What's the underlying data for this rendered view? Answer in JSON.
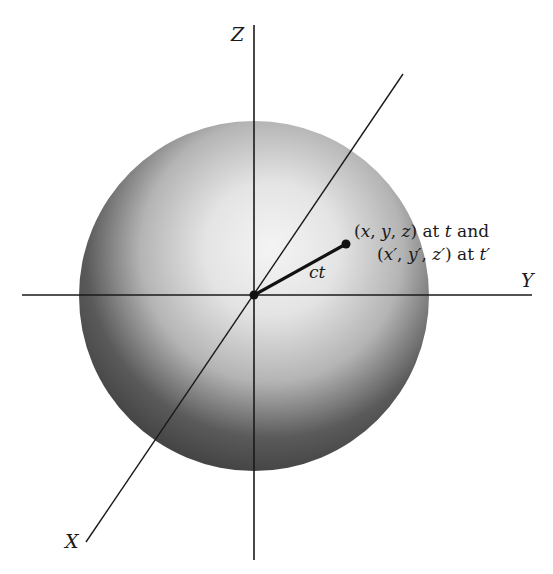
{
  "diagram": {
    "type": "3d-coordinate-system-with-sphere",
    "axes": {
      "z_label": "Z",
      "y_label": "Y",
      "x_label": "X"
    },
    "radius_label": "ct",
    "point_annotation": {
      "line1": {
        "open": "(",
        "x": "x",
        "sep1": ", ",
        "y": "y",
        "sep2": ", ",
        "z": "z",
        "close": ") at ",
        "t": "t",
        "and": " and"
      },
      "line2": {
        "open": "(",
        "x": "x′",
        "sep1": ", ",
        "y": "y′",
        "sep2": ", ",
        "z": "z′",
        "close": ") at ",
        "t": "t′"
      }
    },
    "colors": {
      "line": "#1a1a1a",
      "sphere_highlight": "#f2f2f2",
      "sphere_shadow": "#3a3a3a",
      "background": "#ffffff"
    }
  }
}
